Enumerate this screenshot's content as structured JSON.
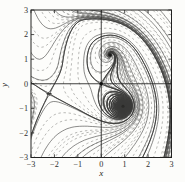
{
  "figure": {
    "background": "#fcfcfa",
    "plot_background": "#fdfdfb"
  },
  "chart_data": {
    "type": "line",
    "subtype": "phase-portrait-direction-field",
    "title": "",
    "xlabel": "x",
    "ylabel": "y",
    "xlim": [
      -3,
      3
    ],
    "ylim": [
      -3,
      3
    ],
    "x_ticks": [
      -3,
      -2,
      -1,
      0,
      1,
      2,
      3
    ],
    "y_ticks": [
      -3,
      -2,
      -1,
      0,
      1,
      2,
      3
    ],
    "frame": true,
    "grid": false,
    "legend": false,
    "axes_through_origin": true,
    "colors": {
      "frame": "#222221",
      "axis": "#2a2a28",
      "solid_curve": "#4d4d4b",
      "dashed_curve": "#8a8a87",
      "separatrix": "#3a3a38",
      "dot": "#111110",
      "tick_label": "#2e2e2c"
    },
    "features": [
      "short dashed streamline segments filling the square (direction field)",
      "solid trajectory curves interleaved with dashed ones",
      "tight stable spiral with dark center in upper-right quadrant",
      "pinwheel vortex with dark center in lower-right quadrant",
      "horizontal convergence point (dark smudge) at left, trajectories fan down-right from it",
      "near-vertical flow in upper-left quadrant",
      "solid dot at the origin where the coordinate axes cross"
    ],
    "equilibria": [
      {
        "x": 0,
        "y": 0,
        "kind": "saddle-dot-at-origin"
      },
      {
        "x": 0.38,
        "y": 1.17,
        "kind": "stable-spiral"
      },
      {
        "x": 0.93,
        "y": -0.92,
        "kind": "spiral-vortex"
      },
      {
        "x": -2.23,
        "y": -0.41,
        "kind": "saddle-node-convergence"
      }
    ],
    "field_model": {
      "form": "w = exp(i*theta) * (z-a)(z-c) * conj(z-o) * conj(z-b), horizontal component damped in upper-left half-plane",
      "theta_deg": 110.5,
      "a": [
        0.38,
        1.17
      ],
      "c": [
        0.93,
        -0.92
      ],
      "b": [
        -2.23,
        -0.41
      ],
      "o": [
        0,
        0
      ],
      "left_damp": 0.85
    }
  }
}
